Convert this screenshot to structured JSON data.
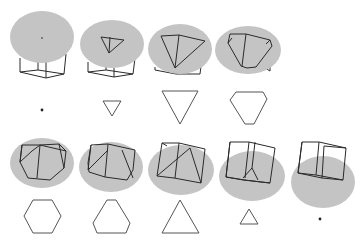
{
  "figure": {
    "colors": {
      "plane": "#c4c4c4",
      "edges": "#2a2a2a",
      "section": "#555555",
      "background": "#ffffff"
    },
    "rows": [
      {
        "panels": [
          {
            "index": 1,
            "section_shape": "point"
          },
          {
            "index": 2,
            "section_shape": "small-triangle"
          },
          {
            "index": 3,
            "section_shape": "large-triangle"
          },
          {
            "index": 4,
            "section_shape": "truncated-triangle"
          }
        ]
      },
      {
        "panels": [
          {
            "index": 5,
            "section_shape": "regular-hexagon"
          },
          {
            "index": 6,
            "section_shape": "truncated-triangle"
          },
          {
            "index": 7,
            "section_shape": "large-triangle"
          },
          {
            "index": 8,
            "section_shape": "small-triangle"
          },
          {
            "index": 9,
            "section_shape": "point"
          }
        ]
      }
    ]
  }
}
